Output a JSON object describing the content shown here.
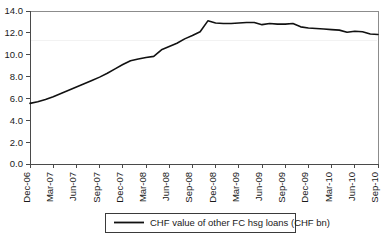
{
  "chart_data": {
    "type": "line",
    "title": "",
    "subtitle": "",
    "xlabel": "",
    "ylabel": "",
    "ylim": [
      0.0,
      14.0
    ],
    "ytick_values": [
      0.0,
      2.0,
      4.0,
      6.0,
      8.0,
      10.0,
      12.0,
      14.0
    ],
    "ytick_labels": [
      "0.0",
      "2.0",
      "4.0",
      "6.0",
      "8.0",
      "10.0",
      "12.0",
      "14.0"
    ],
    "grid": false,
    "legend_position": "bottom",
    "xtick_labels": [
      "Dec-06",
      "Mar-07",
      "Jun-07",
      "Sep-07",
      "Dec-07",
      "Mar-08",
      "Jun-08",
      "Sep-08",
      "Dec-08",
      "Mar-09",
      "Jun-09",
      "Sep-09",
      "Dec-09",
      "Mar-10",
      "Jun-10",
      "Sep-10"
    ],
    "series": [
      {
        "name": "CHF value of other FC hsg loans (CHF bn)",
        "color": "#111111",
        "x": [
          "Dec-06",
          "Jan-07",
          "Feb-07",
          "Mar-07",
          "Apr-07",
          "May-07",
          "Jun-07",
          "Jul-07",
          "Aug-07",
          "Sep-07",
          "Oct-07",
          "Nov-07",
          "Dec-07",
          "Jan-08",
          "Feb-08",
          "Mar-08",
          "Apr-08",
          "May-08",
          "Jun-08",
          "Jul-08",
          "Aug-08",
          "Sep-08",
          "Oct-08",
          "Nov-08",
          "Dec-08",
          "Jan-09",
          "Feb-09",
          "Mar-09",
          "Apr-09",
          "May-09",
          "Jun-09",
          "Jul-09",
          "Aug-09",
          "Sep-09",
          "Oct-09",
          "Nov-09",
          "Dec-09",
          "Jan-10",
          "Feb-10",
          "Mar-10",
          "Apr-10",
          "May-10",
          "Jun-10",
          "Jul-10",
          "Aug-10",
          "Sep-10"
        ],
        "values": [
          5.55,
          5.7,
          5.9,
          6.15,
          6.45,
          6.75,
          7.05,
          7.35,
          7.65,
          7.95,
          8.3,
          8.7,
          9.1,
          9.45,
          9.6,
          9.75,
          9.85,
          10.45,
          10.75,
          11.05,
          11.45,
          11.75,
          12.1,
          13.1,
          12.9,
          12.85,
          12.85,
          12.9,
          12.95,
          12.95,
          12.75,
          12.85,
          12.8,
          12.8,
          12.85,
          12.55,
          12.45,
          12.4,
          12.35,
          12.3,
          12.25,
          12.05,
          12.15,
          12.1,
          11.9,
          11.85
        ]
      }
    ]
  },
  "legend": {
    "entries": [
      {
        "label": "CHF value of other FC hsg loans (CHF bn)"
      }
    ]
  }
}
